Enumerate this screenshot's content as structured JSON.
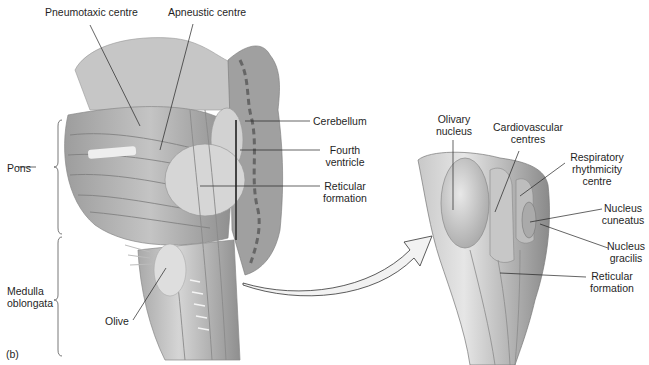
{
  "figure": {
    "panel_label": "(b)",
    "left_view": {
      "labels": {
        "pneumotaxic": "Pneumotaxic centre",
        "apneustic": "Apneustic centre",
        "cerebellum": "Cerebellum",
        "fourth_ventricle_1": "Fourth",
        "fourth_ventricle_2": "ventricle",
        "reticular_1": "Reticular",
        "reticular_2": "formation",
        "pons": "Pons",
        "medulla_1": "Medulla",
        "medulla_2": "oblongata",
        "olive": "Olive"
      }
    },
    "right_view": {
      "labels": {
        "olivary_1": "Olivary",
        "olivary_2": "nucleus",
        "cardio_1": "Cardiovascular",
        "cardio_2": "centres",
        "resp_1": "Respiratory",
        "resp_2": "rhythmicity",
        "resp_3": "centre",
        "cuneatus_1": "Nucleus",
        "cuneatus_2": "cuneatus",
        "gracilis_1": "Nucleus",
        "gracilis_2": "gracilis",
        "reticular_1": "Reticular",
        "reticular_2": "formation"
      }
    },
    "colors": {
      "tissue_dark": "#8a8a8a",
      "tissue_mid": "#b8b8b8",
      "tissue_light": "#dcdcdc",
      "line": "#222222",
      "arrow_fill": "#f2f2f2"
    }
  }
}
